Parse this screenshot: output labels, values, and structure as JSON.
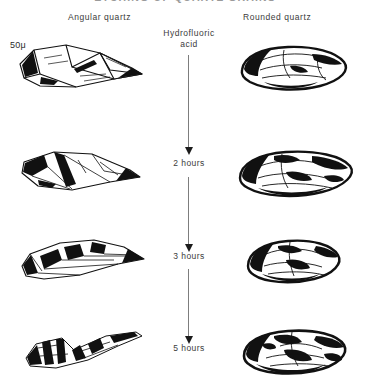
{
  "figure": {
    "title": "ETCHING OF QUARTZ GRAINS",
    "reagent_label_line1": "Hydrofluoric",
    "reagent_label_line2": "acid"
  },
  "columns": [
    {
      "key": "angular",
      "header": "Angular quartz",
      "scale": "50μ"
    },
    {
      "key": "rounded",
      "header": "Rounded quartz",
      "scale": "40μ"
    }
  ],
  "stages": [
    {
      "index": 0,
      "label": ""
    },
    {
      "index": 1,
      "label": "2 hours"
    },
    {
      "index": 2,
      "label": "3 hours"
    },
    {
      "index": 3,
      "label": "5 hours"
    }
  ],
  "specimens": {
    "angular": [
      {
        "stage": "0 hours",
        "caption": "Angular quartz grain, untouched"
      },
      {
        "stage": "2 hours",
        "caption": "Angular quartz grain after 2 hours"
      },
      {
        "stage": "3 hours",
        "caption": "Angular quartz grain after 3 hours"
      },
      {
        "stage": "5 hours",
        "caption": "Angular quartz grain after 5 hours"
      }
    ],
    "rounded": [
      {
        "stage": "0 hours",
        "caption": "Rounded quartz grain, untouched"
      },
      {
        "stage": "2 hours",
        "caption": "Rounded quartz grain after 2 hours"
      },
      {
        "stage": "3 hours",
        "caption": "Rounded quartz grain after 3 hours"
      },
      {
        "stage": "5 hours",
        "caption": "Rounded quartz grain after 5 hours"
      }
    ]
  },
  "colors": {
    "ink": "#1a1a1a",
    "paper": "#ffffff",
    "axis": "#7d7d7d",
    "text": "#3b3b3b"
  }
}
